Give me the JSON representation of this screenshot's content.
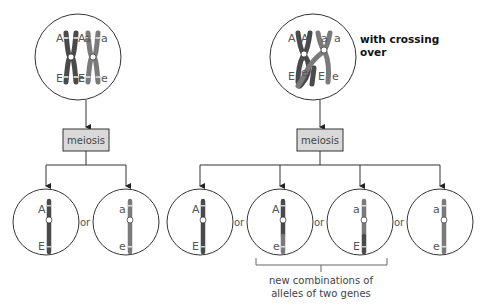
{
  "diagram": {
    "left_panel": {
      "parent_cell": {
        "chromosome_labels": {
          "top": [
            "A",
            "A",
            "a",
            "a"
          ],
          "bottom": [
            "E",
            "E",
            "e",
            "e"
          ]
        }
      },
      "process_label": "meiosis",
      "gametes": [
        {
          "top": "A",
          "bottom": "E"
        },
        {
          "top": "a",
          "bottom": "e"
        }
      ],
      "separator": "or"
    },
    "right_panel": {
      "title_line1": "with crossing",
      "title_line2": "over",
      "parent_cell": {
        "chromosome_labels": {
          "top": [
            "A",
            "A",
            "a",
            "a"
          ],
          "bottom": [
            "E",
            "e",
            "E",
            "e"
          ]
        }
      },
      "process_label": "meiosis",
      "gametes": [
        {
          "top": "A",
          "bottom": "E"
        },
        {
          "top": "A",
          "bottom": "e"
        },
        {
          "top": "a",
          "bottom": "E"
        },
        {
          "top": "a",
          "bottom": "e"
        }
      ],
      "separator": "or",
      "caption_line1": "new combinations of",
      "caption_line2": "alleles of two genes"
    },
    "colors": {
      "dominant_chromosome": "#4a4a4a",
      "recessive_chromosome": "#7a7a7a",
      "box_fill": "#d9d9d9",
      "line": "#333333"
    }
  }
}
